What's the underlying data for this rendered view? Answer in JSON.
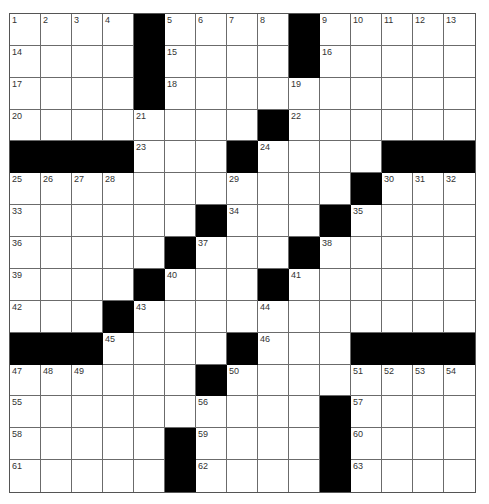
{
  "puzzle": {
    "rows": 15,
    "cols": 15,
    "colors": {
      "block": "#000000",
      "cell": "#ffffff",
      "gridline": "#6b6b6b",
      "number": "#333333"
    },
    "layout": [
      "....#....#.....",
      "....#....#.....",
      "....#..........",
      "........#......",
      "####...#....###",
      "...........#...",
      "......#...#....",
      ".....#...#.....",
      "....#...#......",
      "...#...........",
      "###....#...####",
      "......#........",
      "..........#....",
      ".....#....#....",
      ".....#....#...."
    ],
    "numbers": [
      {
        "n": "1",
        "r": 0,
        "c": 0
      },
      {
        "n": "2",
        "r": 0,
        "c": 1
      },
      {
        "n": "3",
        "r": 0,
        "c": 2
      },
      {
        "n": "4",
        "r": 0,
        "c": 3
      },
      {
        "n": "5",
        "r": 0,
        "c": 5
      },
      {
        "n": "6",
        "r": 0,
        "c": 6
      },
      {
        "n": "7",
        "r": 0,
        "c": 7
      },
      {
        "n": "8",
        "r": 0,
        "c": 8
      },
      {
        "n": "9",
        "r": 0,
        "c": 10
      },
      {
        "n": "10",
        "r": 0,
        "c": 11
      },
      {
        "n": "11",
        "r": 0,
        "c": 12
      },
      {
        "n": "12",
        "r": 0,
        "c": 13
      },
      {
        "n": "13",
        "r": 0,
        "c": 14
      },
      {
        "n": "14",
        "r": 1,
        "c": 0
      },
      {
        "n": "15",
        "r": 1,
        "c": 5
      },
      {
        "n": "16",
        "r": 1,
        "c": 10
      },
      {
        "n": "17",
        "r": 2,
        "c": 0
      },
      {
        "n": "18",
        "r": 2,
        "c": 5
      },
      {
        "n": "19",
        "r": 2,
        "c": 9
      },
      {
        "n": "20",
        "r": 3,
        "c": 0
      },
      {
        "n": "21",
        "r": 3,
        "c": 4
      },
      {
        "n": "22",
        "r": 3,
        "c": 9
      },
      {
        "n": "23",
        "r": 4,
        "c": 4
      },
      {
        "n": "24",
        "r": 4,
        "c": 8
      },
      {
        "n": "25",
        "r": 5,
        "c": 0
      },
      {
        "n": "26",
        "r": 5,
        "c": 1
      },
      {
        "n": "27",
        "r": 5,
        "c": 2
      },
      {
        "n": "28",
        "r": 5,
        "c": 3
      },
      {
        "n": "29",
        "r": 5,
        "c": 7
      },
      {
        "n": "30",
        "r": 5,
        "c": 12
      },
      {
        "n": "31",
        "r": 5,
        "c": 13
      },
      {
        "n": "32",
        "r": 5,
        "c": 14
      },
      {
        "n": "33",
        "r": 6,
        "c": 0
      },
      {
        "n": "34",
        "r": 6,
        "c": 7
      },
      {
        "n": "35",
        "r": 6,
        "c": 11
      },
      {
        "n": "36",
        "r": 7,
        "c": 0
      },
      {
        "n": "37",
        "r": 7,
        "c": 6
      },
      {
        "n": "38",
        "r": 7,
        "c": 10
      },
      {
        "n": "39",
        "r": 8,
        "c": 0
      },
      {
        "n": "40",
        "r": 8,
        "c": 5
      },
      {
        "n": "41",
        "r": 8,
        "c": 9
      },
      {
        "n": "42",
        "r": 9,
        "c": 0
      },
      {
        "n": "43",
        "r": 9,
        "c": 4
      },
      {
        "n": "44",
        "r": 9,
        "c": 8
      },
      {
        "n": "45",
        "r": 10,
        "c": 3
      },
      {
        "n": "46",
        "r": 10,
        "c": 8
      },
      {
        "n": "47",
        "r": 11,
        "c": 0
      },
      {
        "n": "48",
        "r": 11,
        "c": 1
      },
      {
        "n": "49",
        "r": 11,
        "c": 2
      },
      {
        "n": "50",
        "r": 11,
        "c": 7
      },
      {
        "n": "51",
        "r": 11,
        "c": 11
      },
      {
        "n": "52",
        "r": 11,
        "c": 12
      },
      {
        "n": "53",
        "r": 11,
        "c": 13
      },
      {
        "n": "54",
        "r": 11,
        "c": 14
      },
      {
        "n": "55",
        "r": 12,
        "c": 0
      },
      {
        "n": "56",
        "r": 12,
        "c": 6
      },
      {
        "n": "57",
        "r": 12,
        "c": 11
      },
      {
        "n": "58",
        "r": 13,
        "c": 0
      },
      {
        "n": "59",
        "r": 13,
        "c": 6
      },
      {
        "n": "60",
        "r": 13,
        "c": 11
      },
      {
        "n": "61",
        "r": 14,
        "c": 0
      },
      {
        "n": "62",
        "r": 14,
        "c": 6
      },
      {
        "n": "63",
        "r": 14,
        "c": 11
      }
    ]
  }
}
